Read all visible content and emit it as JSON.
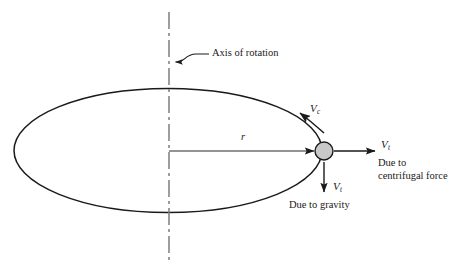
{
  "diagram": {
    "type": "physics-free-body-diagram",
    "background_color": "#ffffff",
    "line_color": "#1a1a1a",
    "particle_fill_color": "#c9c9c9",
    "axis": {
      "label": "Axis of rotation",
      "line_style": "dash-dot centerline",
      "x": 169,
      "y_top": 12,
      "y_bottom": 262
    },
    "orbit": {
      "shape": "ellipse",
      "center_x": 168,
      "center_y": 150,
      "radius_x": 154,
      "radius_y": 62
    },
    "particle": {
      "center_x": 324,
      "center_y": 151,
      "radius": 9
    },
    "radius_line": {
      "label": "r",
      "from_x": 169,
      "to_x": 315,
      "y": 151
    },
    "vectors": [
      {
        "name": "tangential-velocity",
        "label": "V",
        "subscript": "c",
        "direction": "tangent along orbit path",
        "caption": ""
      },
      {
        "name": "centrifugal-velocity",
        "label": "V",
        "subscript": "t",
        "direction": "outward horizontal (right)",
        "caption_line1": "Due to",
        "caption_line2": "centrifugal force"
      },
      {
        "name": "gravity-velocity",
        "label": "V",
        "subscript": "t",
        "direction": "downward",
        "caption": "Due to gravity"
      }
    ]
  }
}
